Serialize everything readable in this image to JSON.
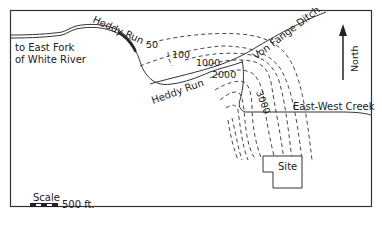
{
  "map": {
    "labels": {
      "heddy_run_upper": "Heddy Run",
      "heddy_run_lower": "Heddy Run",
      "east_fork_line1": "to East Fork",
      "east_fork_line2": "of White River",
      "von_fange_ditch": "Von Fange Ditch",
      "east_west_creek": "East-West Creek",
      "site": "Site",
      "north": "North"
    },
    "contours": {
      "c50": "50",
      "c100": "100",
      "c1000": "1000",
      "c2000": "2000",
      "c3000": "3000"
    },
    "scale": {
      "title": "Scale",
      "distance": "500 ft."
    }
  }
}
